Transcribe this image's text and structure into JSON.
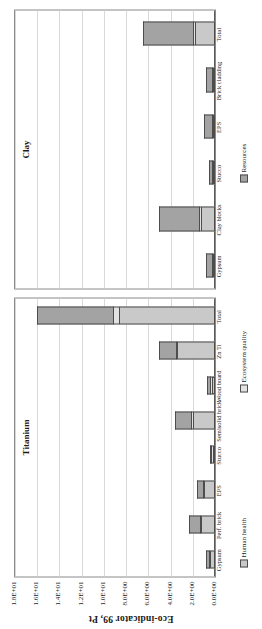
{
  "chart_data": {
    "type": "bar",
    "title": "",
    "xlabel": "",
    "ylabel": "Eco-indicator 99, Pt",
    "ylim": [
      0,
      18
    ],
    "yticks": [
      "0.0E+00",
      "2.0E+00",
      "4.0E+00",
      "6.0E+00",
      "8.0E+00",
      "1.0E+01",
      "1.2E+01",
      "1.4E+01",
      "1.6E+01",
      "1.8E+01"
    ],
    "ytick_values": [
      0,
      2,
      4,
      6,
      8,
      10,
      12,
      14,
      16,
      18
    ],
    "grid": true,
    "stacked": true,
    "legend_position": "bottom",
    "legend": [
      "Human health",
      "Ecosystem quality",
      "Resources"
    ],
    "series_colors": [
      "#c9c9c9",
      "#e2e2e2",
      "#a3a3a3"
    ],
    "panels": [
      {
        "title": "Titanium",
        "categories": [
          "Gypsum",
          "Perf. brick",
          "EPS",
          "Stucco",
          "Semisolid brick",
          "Wood board",
          "Zn Ti",
          "Total"
        ],
        "series": [
          {
            "name": "Human health",
            "values": [
              0.45,
              1.25,
              0.95,
              0.22,
              2.0,
              0.3,
              3.4,
              8.6
            ]
          },
          {
            "name": "Ecosystem quality",
            "values": [
              0.05,
              0.1,
              0.06,
              0.02,
              0.12,
              0.03,
              0.15,
              0.55
            ]
          },
          {
            "name": "Resources",
            "values": [
              0.25,
              0.95,
              0.55,
              0.15,
              1.5,
              0.3,
              1.45,
              6.9
            ]
          }
        ],
        "totals": [
          0.75,
          2.3,
          1.56,
          0.39,
          3.62,
          0.63,
          5.0,
          16.05
        ]
      },
      {
        "title": "Clay",
        "categories": [
          "Gypsum",
          "Clay blocks",
          "Stucco",
          "EPS",
          "Brick cladding",
          "Total"
        ],
        "series": [
          {
            "name": "Human health",
            "values": [
              0.18,
              1.3,
              0.1,
              0.1,
              0.12,
              1.8
            ]
          },
          {
            "name": "Ecosystem quality",
            "values": [
              0.02,
              0.12,
              0.01,
              0.01,
              0.01,
              0.17
            ]
          },
          {
            "name": "Resources",
            "values": [
              0.55,
              3.6,
              0.22,
              0.7,
              0.5,
              4.55
            ]
          }
        ],
        "totals": [
          0.75,
          5.02,
          0.33,
          0.81,
          0.63,
          6.52
        ]
      }
    ]
  },
  "axis": {
    "ylabel": "Eco-indicator 99, Pt"
  },
  "panels": {
    "titanium_title": "Titanium",
    "clay_title": "Clay"
  },
  "legend": {
    "human_health": "Human health",
    "ecosystem_quality": "Ecosystem quality",
    "resources": "Resources"
  }
}
